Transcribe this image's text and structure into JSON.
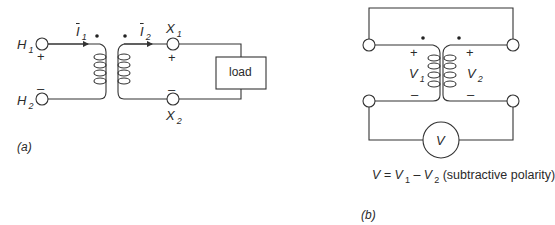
{
  "figure_a": {
    "caption": "(a)",
    "terminals": {
      "h1": {
        "label": "H",
        "sub": "1",
        "polarity": "+"
      },
      "h2": {
        "label": "H",
        "sub": "2",
        "polarity": "–"
      },
      "x1": {
        "label": "X",
        "sub": "1",
        "polarity": "+"
      },
      "x2": {
        "label": "X",
        "sub": "2",
        "polarity": "–"
      }
    },
    "currents": {
      "i1": {
        "label": "I",
        "sub": "1"
      },
      "i2": {
        "label": "I",
        "sub": "2"
      }
    },
    "load_label": "load"
  },
  "figure_b": {
    "caption": "(b)",
    "v1": {
      "label": "V",
      "sub": "1",
      "plus": "+",
      "minus": "–"
    },
    "v2": {
      "label": "V",
      "sub": "2",
      "plus": "+",
      "minus": "–"
    },
    "meter_label": "V",
    "equation": {
      "lhs": "V = V",
      "sub1": "1",
      "mid": " – V",
      "sub2": "2",
      "note": " (subtractive polarity)"
    }
  }
}
